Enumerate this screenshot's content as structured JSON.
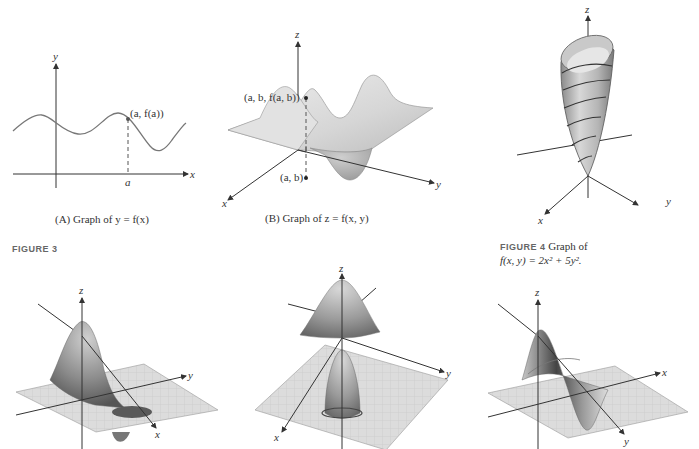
{
  "panel_a": {
    "axis_y": "y",
    "axis_x": "x",
    "point_label": "(a, f(a))",
    "tick_label": "a",
    "caption": "(A)  Graph of  y = f(x)"
  },
  "panel_b": {
    "axis_z": "z",
    "axis_y": "y",
    "axis_x": "x",
    "point_label": "(a, b, f(a, b))",
    "base_label": "(a, b)",
    "caption": "(B)  Graph of  z = f(x, y)"
  },
  "figure3": {
    "label": "FIGURE 3"
  },
  "figure4": {
    "tag": "FIGURE 4",
    "line1": "Graph of",
    "line2": "f(x, y) = 2x² + 5y².",
    "axis_z": "z",
    "axis_y": "y",
    "axis_x": "x"
  },
  "bottom_plots": [
    {
      "axis_z": "z",
      "axis_y": "y",
      "axis_x": "x"
    },
    {
      "axis_z": "z",
      "axis_y": "y",
      "axis_x": "x"
    },
    {
      "axis_z": "z",
      "axis_y": "y",
      "axis_x": "x"
    }
  ]
}
